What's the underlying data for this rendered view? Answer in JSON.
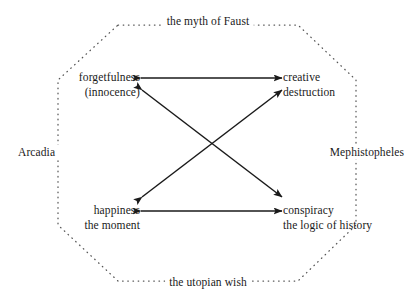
{
  "diagram": {
    "title": "the myth of Faust",
    "shape": "octagon",
    "outline_style": "dotted",
    "colors": {
      "ink": "#1a1a1a",
      "outline": "#555555",
      "background": "#ffffff"
    },
    "nodes": [
      {
        "id": "forgetfulness",
        "line1": "forgetfulness",
        "line2": "(innocence)",
        "position": "top-left"
      },
      {
        "id": "creative-destruction",
        "line1": "creative",
        "line2": "destruction",
        "position": "top-right"
      },
      {
        "id": "happiness",
        "line1": "happiness",
        "line2": "the moment",
        "position": "bottom-left"
      },
      {
        "id": "conspiracy",
        "line1": "conspiracy",
        "line2": "the logic of history",
        "position": "bottom-right"
      }
    ],
    "perimeter_labels": [
      {
        "id": "faust",
        "text": "the myth of Faust",
        "position": "top"
      },
      {
        "id": "arcadia",
        "text": "Arcadia",
        "position": "left"
      },
      {
        "id": "mephisto",
        "text": "Mephistopheles",
        "position": "right"
      },
      {
        "id": "utopian",
        "text": "the utopian wish",
        "position": "bottom"
      }
    ],
    "connectors": [
      {
        "id": "top-horizontal",
        "from": "forgetfulness",
        "to": "creative-destruction",
        "arrows": "both"
      },
      {
        "id": "bottom-horizontal",
        "from": "happiness",
        "to": "conspiracy",
        "arrows": "both"
      },
      {
        "id": "diagonal-nw-se",
        "from": "forgetfulness",
        "to": "conspiracy",
        "arrows": "both"
      },
      {
        "id": "diagonal-sw-ne",
        "from": "happiness",
        "to": "creative-destruction",
        "arrows": "both"
      }
    ]
  }
}
